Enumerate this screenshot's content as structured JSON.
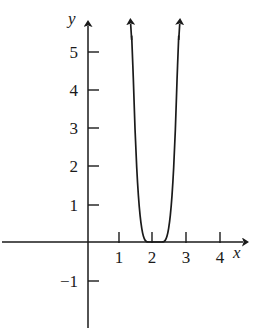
{
  "chart_data": {
    "type": "line",
    "title": "",
    "xlabel": "x",
    "ylabel": "y",
    "xlim": [
      -0.6,
      4.6
    ],
    "ylim": [
      -1.7,
      5.9
    ],
    "grid": false,
    "legend": null,
    "axis_arrows": [
      "x-positive",
      "y-positive"
    ],
    "xticks": [
      1,
      2,
      3,
      4
    ],
    "xtick_labels": [
      "1",
      "2",
      "3",
      "4"
    ],
    "yticks": [
      -1,
      1,
      2,
      3,
      4,
      5
    ],
    "ytick_labels": [
      "-1",
      "1",
      "2",
      "3",
      "4",
      "5"
    ],
    "curve": {
      "name": "even-power curve",
      "description": "steep U-shaped curve with flat bottom touching the x-axis, vertex at (2, 0)",
      "vertex": [
        2,
        0
      ],
      "color": "#1a1a1a",
      "branch_arrows": 2,
      "x": [
        1.3,
        1.35,
        1.4,
        1.45,
        1.5,
        1.55,
        1.6,
        1.65,
        1.7,
        1.75,
        1.8,
        1.85,
        1.9,
        1.95,
        2.0,
        2.05,
        2.1,
        2.15,
        2.2,
        2.25,
        2.3,
        2.35,
        2.4,
        2.45,
        2.5,
        2.55,
        2.6,
        2.65,
        2.7
      ],
      "y": [
        5.95,
        4.27,
        2.96,
        1.96,
        1.22,
        0.7,
        0.36,
        0.15,
        0.046,
        0.0078,
        0.0004,
        0.0,
        0.0,
        0.0,
        0.0,
        0.0,
        0.0,
        0.0,
        0.0004,
        0.0078,
        0.046,
        0.15,
        0.36,
        0.7,
        1.22,
        1.96,
        2.96,
        4.27,
        5.95
      ]
    }
  },
  "labels": {
    "y_axis": "y",
    "x_axis": "x",
    "y5": "5",
    "y4": "4",
    "y3": "3",
    "y2": "2",
    "y1": "1",
    "ym1": "−1",
    "x1": "1",
    "x2": "2",
    "x3": "3",
    "x4": "4"
  },
  "colors": {
    "ink": "#1a1a1a",
    "background": "#ffffff"
  }
}
